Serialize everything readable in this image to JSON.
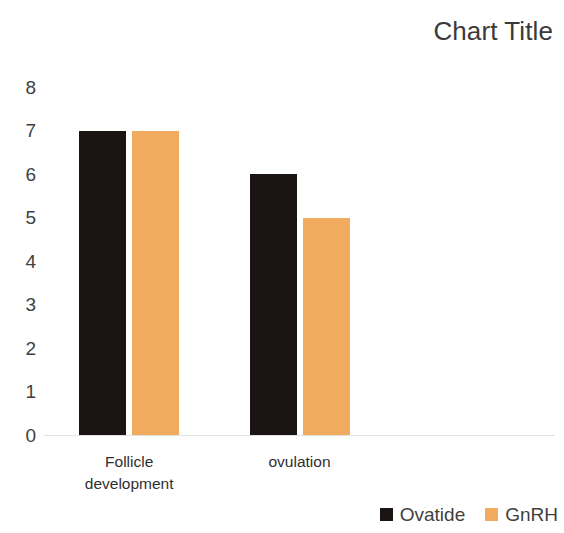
{
  "chart_data": {
    "type": "bar",
    "title": "Chart Title",
    "xlabel": "",
    "ylabel": "",
    "categories": [
      "Follicle development",
      "ovulation"
    ],
    "category_lines": [
      [
        "Follicle",
        "development"
      ],
      [
        "ovulation"
      ]
    ],
    "series": [
      {
        "name": "Ovatide",
        "color": "#1a1412",
        "values": [
          7,
          6
        ]
      },
      {
        "name": "GnRH",
        "color": "#f0ab5e",
        "values": [
          7,
          5
        ]
      }
    ],
    "ylim": [
      0,
      8
    ],
    "ytick_step": 1,
    "yticks": [
      "8",
      "7",
      "6",
      "5",
      "4",
      "3",
      "2",
      "1",
      "0"
    ],
    "grid": false,
    "legend_position": "bottom-right",
    "background_color": "#ffffff",
    "axis_line_color": "#e2e2e2"
  }
}
